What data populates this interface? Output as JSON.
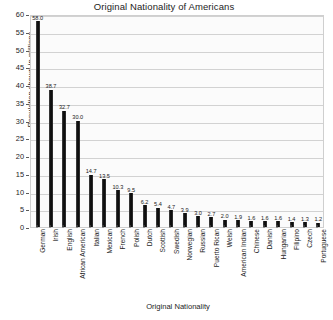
{
  "chart_data": {
    "type": "bar",
    "title": "Original Nationality of Americans",
    "xlabel": "Original Nationality",
    "ylabel": "Population shown in millions",
    "ylim": [
      0,
      60
    ],
    "ytick_step": 5,
    "yticks": [
      "0",
      "5",
      "10",
      "15",
      "20",
      "25",
      "30",
      "35",
      "40",
      "45",
      "50",
      "55",
      "60"
    ],
    "grid": "horizontal",
    "legend": "none",
    "bar_color": "#111111",
    "plot_background": "#fbfbfb",
    "gridline_color": "#d2d2d2",
    "categories": [
      "German",
      "Irish",
      "English",
      "African American",
      "Italian",
      "Mexican",
      "French",
      "Polish",
      "Dutch",
      "Scottish",
      "Swedish",
      "Norwegian",
      "Russian",
      "Puerto Rican",
      "Welsh",
      "American Indian",
      "Chinese",
      "Danish",
      "Hungarian",
      "Filipino",
      "Czech",
      "Portuguese"
    ],
    "values": [
      58.0,
      38.7,
      32.7,
      30.0,
      14.7,
      13.5,
      10.3,
      9.5,
      6.2,
      5.4,
      4.7,
      3.9,
      3.0,
      2.7,
      2.0,
      1.9,
      1.6,
      1.6,
      1.6,
      1.4,
      1.3,
      1.2
    ],
    "value_labels": [
      "58.0",
      "38.7",
      "32.7",
      "30.0",
      "14.7",
      "13.5",
      "10.3",
      "9.5",
      "6.2",
      "5.4",
      "4.7",
      "3.9",
      "3.0",
      "2.7",
      "2.0",
      "1.9",
      "1.6",
      "1.6",
      "1.6",
      "1.4",
      "1.3",
      "1.2"
    ]
  }
}
